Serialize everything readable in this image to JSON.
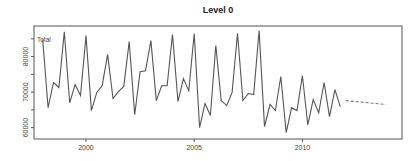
{
  "chart_data": {
    "type": "line",
    "title": "Level 0",
    "xlabel": "",
    "ylabel": "",
    "xlim": [
      1997.6,
      2014.6
    ],
    "ylim": [
      56800,
      88600
    ],
    "grid": false,
    "x_ticks": [
      2000,
      2005,
      2010
    ],
    "x_tick_labels": [
      "2000",
      "2005",
      "2010"
    ],
    "y_ticks": [
      60000,
      65000,
      70000,
      75000,
      80000,
      85000
    ],
    "y_tick_labels": [
      "60000",
      "",
      "70000",
      "",
      "80000",
      ""
    ],
    "annotations": [
      {
        "text": "Total",
        "position": "top-left"
      }
    ],
    "series": [
      {
        "name": "Total",
        "style": "solid",
        "color": "#555555",
        "start": 1998.0,
        "frequency": 4,
        "values": [
          84800,
          65600,
          72700,
          71300,
          87000,
          67000,
          72100,
          69000,
          85900,
          64800,
          69900,
          71800,
          80600,
          68200,
          70100,
          71600,
          84200,
          63600,
          75700,
          76000,
          84500,
          67600,
          71800,
          71800,
          86200,
          67300,
          73800,
          70400,
          86500,
          60000,
          66800,
          63400,
          83100,
          67600,
          66200,
          69900,
          86500,
          67600,
          69600,
          69300,
          87300,
          60300,
          66500,
          64800,
          74400,
          58600,
          65600,
          64800,
          74600,
          60800,
          67900,
          64200,
          72700,
          63100,
          70700,
          65900
        ]
      },
      {
        "name": "Forecast",
        "style": "dashed",
        "color": "#777777",
        "x": [
          2012.0,
          2013.85
        ],
        "values": [
          67600,
          66500
        ]
      }
    ]
  }
}
